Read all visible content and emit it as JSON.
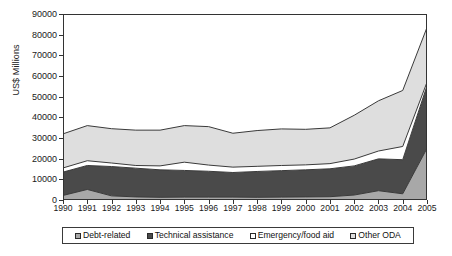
{
  "chart_data": {
    "type": "area",
    "title": "",
    "xlabel": "",
    "ylabel": "US$ Millions",
    "stacked": true,
    "grid": false,
    "legend_position": "bottom",
    "ylim": [
      0,
      90000
    ],
    "ytick_step": 10000,
    "yticks": [
      "0",
      "10000",
      "20000",
      "30000",
      "40000",
      "50000",
      "60000",
      "70000",
      "80000",
      "90000"
    ],
    "categories": [
      "1990",
      "1991",
      "1992",
      "1993",
      "1994",
      "1995",
      "1996",
      "1997",
      "1998",
      "1999",
      "2000",
      "2001",
      "2002",
      "2003",
      "2004",
      "2005"
    ],
    "series": [
      {
        "name": "Debt-related",
        "color": "#a8a8a8",
        "values": [
          2200,
          5100,
          2000,
          1500,
          1300,
          1400,
          1400,
          1400,
          1300,
          1400,
          1500,
          1600,
          2400,
          4500,
          3000,
          25000
        ]
      },
      {
        "name": "Technical assistance",
        "color": "#4a4a4a",
        "values": [
          11300,
          11600,
          14200,
          13900,
          13300,
          12900,
          12500,
          11900,
          12500,
          12800,
          13100,
          13500,
          14100,
          15400,
          16500,
          30300
        ]
      },
      {
        "name": "Emergency/food aid",
        "color": "#ffffff",
        "values": [
          2000,
          2300,
          1700,
          1300,
          1900,
          4000,
          3000,
          2600,
          2500,
          2500,
          2400,
          2500,
          3300,
          3800,
          6400,
          1700
        ]
      },
      {
        "name": "Other ODA",
        "color": "#dedede",
        "values": [
          16500,
          17000,
          16600,
          17100,
          17300,
          17700,
          18600,
          16400,
          17300,
          17700,
          17200,
          17300,
          21200,
          24300,
          27100,
          26500
        ]
      }
    ],
    "totals": [
      32000,
      36000,
      34500,
      33800,
      33800,
      36000,
      35500,
      32300,
      33600,
      34400,
      34200,
      34900,
      41000,
      48000,
      53000,
      83500
    ]
  },
  "legend": {
    "items": [
      {
        "label": "Debt-related",
        "swatch_name": "legend-swatch-debt-related"
      },
      {
        "label": "Technical assistance",
        "swatch_name": "legend-swatch-technical-assistance"
      },
      {
        "label": "Emergency/food aid",
        "swatch_name": "legend-swatch-emergency-food-aid"
      },
      {
        "label": "Other ODA",
        "swatch_name": "legend-swatch-other-oda"
      }
    ]
  },
  "style": {
    "axis_color": "#333333",
    "series_outline": "#3a3a3a",
    "plot_background": "#ffffff"
  }
}
